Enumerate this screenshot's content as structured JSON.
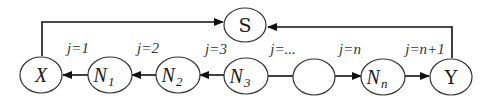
{
  "diagram": {
    "type": "directed-graph",
    "nodes": [
      {
        "id": "S",
        "label": "S"
      },
      {
        "id": "X",
        "label": "X"
      },
      {
        "id": "N1",
        "label": "N",
        "sub": "1"
      },
      {
        "id": "N2",
        "label": "N",
        "sub": "2"
      },
      {
        "id": "N3",
        "label": "N",
        "sub": "3"
      },
      {
        "id": "blank",
        "label": ""
      },
      {
        "id": "Nn",
        "label": "N",
        "sub": "n"
      },
      {
        "id": "Y",
        "label": "Y"
      }
    ],
    "edge_labels": [
      {
        "text": "j=1"
      },
      {
        "text": "j=2"
      },
      {
        "text": "j=3"
      },
      {
        "text": "j=..."
      },
      {
        "text": "j=n"
      },
      {
        "text": "j=n+1"
      }
    ],
    "edges": [
      {
        "from": "X",
        "to": "S"
      },
      {
        "from": "Y",
        "to": "S"
      },
      {
        "from": "N1",
        "to": "X"
      },
      {
        "from": "N2",
        "to": "N1"
      },
      {
        "from": "N3",
        "to": "N2"
      },
      {
        "from": "N3",
        "to": "blank",
        "arrow": false
      },
      {
        "from": "blank",
        "to": "Nn"
      },
      {
        "from": "Nn",
        "to": "Y"
      }
    ]
  }
}
